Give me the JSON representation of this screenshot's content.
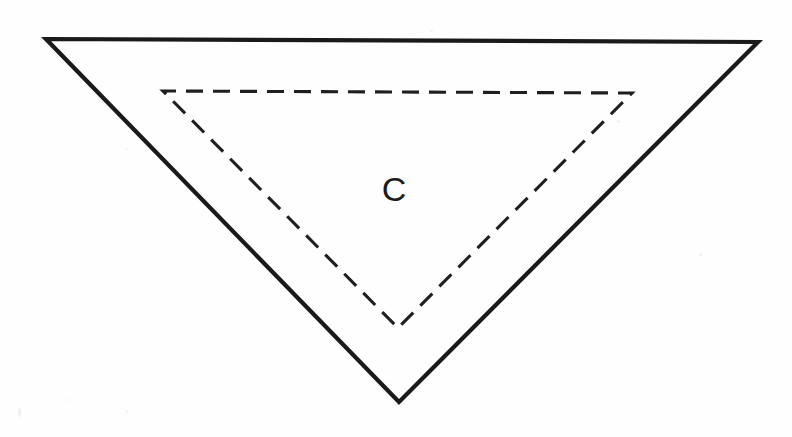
{
  "figure": {
    "background_color": "#fefefe",
    "width": 792,
    "height": 437,
    "labels": [
      {
        "name": "region-label-c",
        "text": "C",
        "x": 394,
        "y": 201,
        "font_size": 34,
        "color": "#1c1c1c"
      }
    ],
    "shapes": {
      "outer_triangle": {
        "name": "outer-solid-triangle",
        "style": "solid",
        "stroke_color": "#1a1a1a",
        "stroke_width": 4.2,
        "points": "46,39 758,42 399,402",
        "vertices": [
          {
            "label": "top-left",
            "x": 46,
            "y": 39
          },
          {
            "label": "top-right",
            "x": 758,
            "y": 42
          },
          {
            "label": "bottom-apex",
            "x": 399,
            "y": 402
          }
        ]
      },
      "inner_triangle": {
        "name": "inner-dashed-triangle",
        "style": "dashed",
        "stroke_color": "#1f1f1f",
        "stroke_width": 3.1,
        "dash_length": 17,
        "gap_length": 10,
        "points": "163,91 632,93 398,328",
        "vertices": [
          {
            "label": "top-left",
            "x": 163,
            "y": 91
          },
          {
            "label": "top-right",
            "x": 632,
            "y": 93
          },
          {
            "label": "bottom-apex",
            "x": 398,
            "y": 328
          }
        ]
      }
    }
  }
}
